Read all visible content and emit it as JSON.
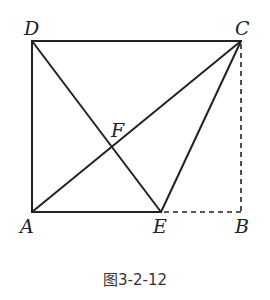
{
  "figure": {
    "caption": "图3-2-12",
    "points": {
      "A": {
        "label": "A",
        "x": 32,
        "y": 212
      },
      "B": {
        "label": "B",
        "x": 241,
        "y": 212
      },
      "C": {
        "label": "C",
        "x": 241,
        "y": 41
      },
      "D": {
        "label": "D",
        "x": 32,
        "y": 41
      },
      "E": {
        "label": "E",
        "x": 161,
        "y": 212
      },
      "F": {
        "label": "F",
        "x": 112,
        "y": 147
      }
    },
    "solid_segments": [
      "DC",
      "DA",
      "AE",
      "AC",
      "DE",
      "CE"
    ],
    "dashed_segments": [
      "CB",
      "EB"
    ],
    "colors": {
      "line": "#222222",
      "background": "#ffffff"
    }
  }
}
